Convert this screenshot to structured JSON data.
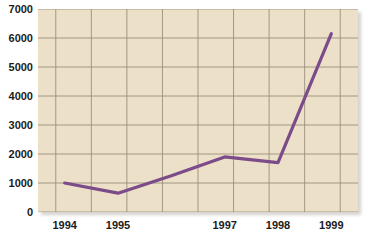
{
  "chart_data": {
    "type": "line",
    "title": "",
    "subtitle": "",
    "xlabel": "",
    "ylabel": "",
    "x": [
      1994,
      1995,
      1996,
      1997,
      1998,
      1999
    ],
    "series": [
      {
        "name": "",
        "values": [
          1000,
          650,
          1250,
          1900,
          1700,
          6150
        ],
        "color": "#7b4b8a"
      }
    ],
    "xlim": [
      1993.5,
      1999.5
    ],
    "ylim": [
      0,
      7000
    ],
    "y_ticks": [
      0,
      1000,
      2000,
      3000,
      4000,
      5000,
      6000,
      7000
    ],
    "y_tick_labels": [
      "0",
      "1000",
      "2000",
      "3000",
      "4000",
      "5000",
      "6000",
      "7000"
    ],
    "x_ticks": [
      1994,
      1995,
      1997,
      1998,
      1999
    ],
    "x_tick_labels": [
      "1994",
      "1995",
      "1997",
      "1998",
      "1999"
    ],
    "gridlines": {
      "horizontal": true,
      "vertical": true,
      "vertical_count": 9,
      "color": "#9a8f7c"
    },
    "legend": {
      "visible": false,
      "position": "none",
      "entries": []
    },
    "plot_background": "#ece0c8",
    "figure_background": "#ffffff",
    "annotations": []
  }
}
